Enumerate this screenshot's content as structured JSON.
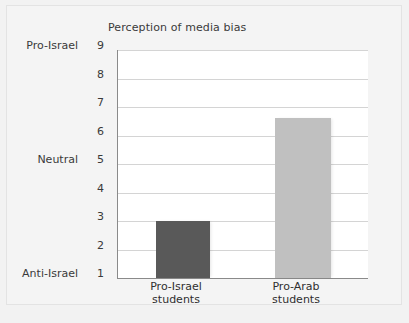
{
  "chart_data": {
    "type": "bar",
    "title": "Perception of media bias",
    "xlabel": "",
    "ylabel": "",
    "categories": [
      "Pro-Israel students",
      "Pro-Arab students"
    ],
    "category_lines": [
      [
        "Pro-Israel",
        "students"
      ],
      [
        "Pro-Arab",
        "students"
      ]
    ],
    "values": [
      3.0,
      6.6
    ],
    "ylim": [
      1,
      9
    ],
    "yticks": [
      1,
      2,
      3,
      4,
      5,
      6,
      7,
      8,
      9
    ],
    "ytick_labels": [
      "1",
      "2",
      "3",
      "4",
      "5",
      "6",
      "7",
      "8",
      "9"
    ],
    "y_category_labels": [
      {
        "value": 9,
        "label": "Pro-Israel"
      },
      {
        "value": 5,
        "label": "Neutral"
      },
      {
        "value": 1,
        "label": "Anti-Israel"
      }
    ],
    "grid": true,
    "legend": null,
    "bar_colors": [
      "#595959",
      "#c0c0c0"
    ],
    "series": [
      {
        "name": "Perception of media bias",
        "values": [
          3.0,
          6.6
        ]
      }
    ]
  },
  "colors": {
    "figure_background": "#f2f2f2",
    "plot_background": "#ffffff",
    "axis": "#8a8a8a",
    "gridline": "#d4d4d4",
    "text": "#3a3a3a",
    "bar_pro_israel": "#595959",
    "bar_pro_arab": "#c0c0c0"
  }
}
